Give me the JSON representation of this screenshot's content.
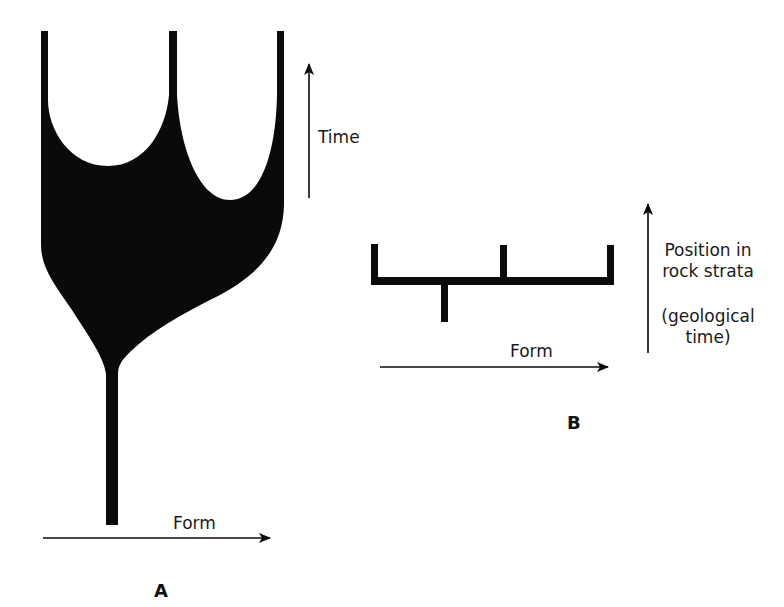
{
  "figure": {
    "ink_color": "#0a0a0a",
    "background": "#ffffff",
    "panel_a": {
      "label": "A",
      "x_axis_label": "Form",
      "y_axis_label": "Time",
      "description": "Gradualistic branching: a single lineage widens continuously over time and splits into three branches"
    },
    "panel_b": {
      "label": "B",
      "x_axis_label": "Form",
      "y_axis_label_lines": [
        "Position in",
        "rock strata",
        "(geological",
        "time)"
      ],
      "description": "Punctuated pattern: abrupt horizontal shift in form with vertical stasis branches"
    }
  }
}
